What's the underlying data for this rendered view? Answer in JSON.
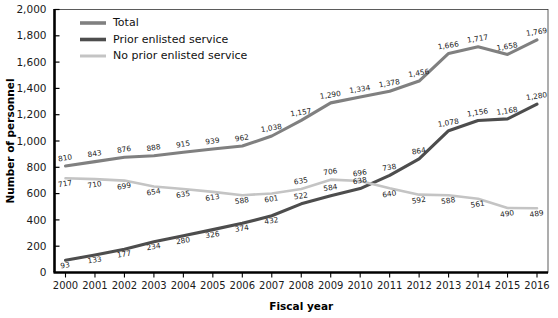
{
  "chart_data": {
    "type": "line",
    "title": "",
    "xlabel": "Fiscal year",
    "ylabel": "Number of personnel",
    "ylim": [
      0,
      2000
    ],
    "ytick_labels": [
      "0",
      "200",
      "400",
      "600",
      "800",
      "1,000",
      "1,200",
      "1,400",
      "1,600",
      "1,800",
      "2,000"
    ],
    "yticks": [
      0,
      200,
      400,
      600,
      800,
      1000,
      1200,
      1400,
      1600,
      1800,
      2000
    ],
    "grid": false,
    "legend_position": "top-left",
    "categories": [
      "2000",
      "2001",
      "2002",
      "2003",
      "2004",
      "2005",
      "2006",
      "2007",
      "2008",
      "2009",
      "2010",
      "2011",
      "2012",
      "2013",
      "2014",
      "2015",
      "2016"
    ],
    "x": [
      2000,
      2001,
      2002,
      2003,
      2004,
      2005,
      2006,
      2007,
      2008,
      2009,
      2010,
      2011,
      2012,
      2013,
      2014,
      2015,
      2016
    ],
    "series": [
      {
        "name": "Total",
        "color": "#808080",
        "values": [
          810,
          843,
          876,
          888,
          915,
          939,
          962,
          1038,
          1157,
          1290,
          1334,
          1378,
          1456,
          1666,
          1717,
          1658,
          1769
        ],
        "labels": [
          "810",
          "843",
          "876",
          "888",
          "915",
          "939",
          "962",
          "1,038",
          "1,157",
          "1,290",
          "1,334",
          "1,378",
          "1,456",
          "1,666",
          "1,717",
          "1,658",
          "1,769"
        ]
      },
      {
        "name": "Prior enlisted service",
        "color": "#4d4d4d",
        "values": [
          93,
          133,
          177,
          234,
          280,
          326,
          374,
          432,
          522,
          584,
          638,
          738,
          864,
          1078,
          1156,
          1168,
          1280
        ],
        "labels": [
          "93",
          "133",
          "177",
          "234",
          "280",
          "326",
          "374",
          "432",
          "522",
          "584",
          "638",
          "738",
          "864",
          "1,078",
          "1,156",
          "1,168",
          "1,280"
        ]
      },
      {
        "name": "No prior enlisted service",
        "color": "#c4c4c4",
        "values": [
          717,
          710,
          699,
          654,
          635,
          613,
          588,
          601,
          635,
          706,
          696,
          640,
          592,
          588,
          561,
          490,
          489
        ],
        "labels": [
          "717",
          "710",
          "699",
          "654",
          "635",
          "613",
          "588",
          "601",
          "635",
          "706",
          "696",
          "640",
          "592",
          "588",
          "561",
          "490",
          "489"
        ]
      }
    ]
  }
}
